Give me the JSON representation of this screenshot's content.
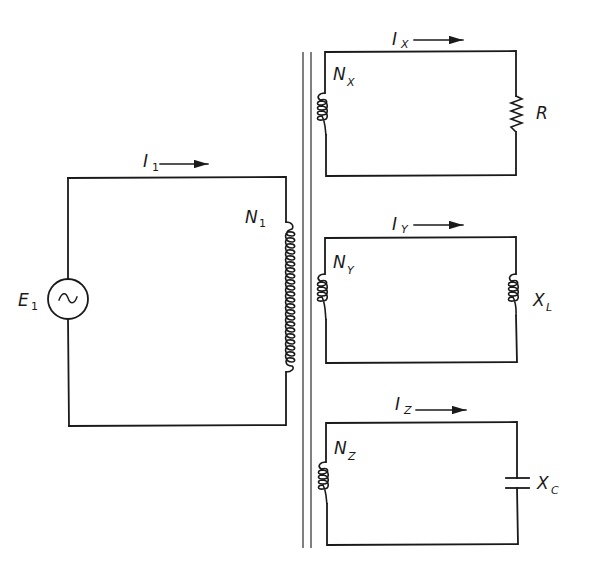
{
  "diagram": {
    "type": "transformer-multiple-secondaries",
    "colors": {
      "line": "#1a1a1a",
      "core": "#4a4a4a",
      "background": "#ffffff"
    },
    "primary": {
      "source": {
        "symbol": "E",
        "subscript": "1",
        "glyph": "~"
      },
      "current": {
        "symbol": "I",
        "subscript": "1"
      },
      "winding": {
        "symbol": "N",
        "subscript": "1",
        "turns_drawn": 14
      }
    },
    "core": {
      "label": "iron-core",
      "lines": 2
    },
    "secondaries": [
      {
        "current": {
          "symbol": "I",
          "subscript": "X"
        },
        "winding": {
          "symbol": "N",
          "subscript": "X",
          "turns_drawn": 4
        },
        "load": {
          "type": "resistor",
          "symbol": "R",
          "subscript": ""
        }
      },
      {
        "current": {
          "symbol": "I",
          "subscript": "Y"
        },
        "winding": {
          "symbol": "N",
          "subscript": "Y",
          "turns_drawn": 4
        },
        "load": {
          "type": "inductor",
          "symbol": "X",
          "subscript": "L"
        }
      },
      {
        "current": {
          "symbol": "I",
          "subscript": "Z"
        },
        "winding": {
          "symbol": "N",
          "subscript": "Z",
          "turns_drawn": 4
        },
        "load": {
          "type": "capacitor",
          "symbol": "X",
          "subscript": "C"
        }
      }
    ]
  }
}
